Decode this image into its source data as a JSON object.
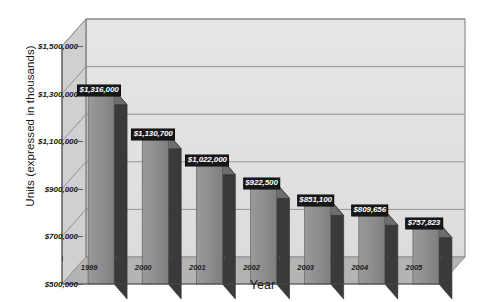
{
  "chart_data": {
    "type": "bar",
    "title": "",
    "subtitle": "",
    "xlabel": "Year",
    "ylabel": "Units (expressed in thousands)",
    "categories": [
      "1999",
      "2000",
      "2001",
      "2002",
      "2003",
      "2004",
      "2005"
    ],
    "values": [
      1316000,
      1130700,
      1022000,
      922500,
      851100,
      809656,
      757823
    ],
    "data_labels": [
      "$1,316,000",
      "$1,130,700",
      "$1,022,000",
      "$922,500",
      "$851,100",
      "$809,656",
      "$757,823"
    ],
    "ylim": [
      500000,
      1500000
    ],
    "ytick_values": [
      500000,
      700000,
      900000,
      1100000,
      1300000,
      1500000
    ],
    "ytick_labels": [
      "$500,000",
      "$700,000",
      "$900,000",
      "$1,100,000",
      "$1,300,000",
      "$1,500,000"
    ],
    "grid": true,
    "legend": null,
    "three_d": true,
    "series": [
      {
        "name": "Units",
        "values": [
          1316000,
          1130700,
          1022000,
          922500,
          851100,
          809656,
          757823
        ]
      }
    ]
  },
  "colors": {
    "bar_front": "#8e8e8e",
    "bar_side": "#3a3a3a",
    "bar_top": "#6d6d6d",
    "plot_back_wall": "#e2e2e2",
    "plot_side_wall": "#d0d0d0",
    "plot_floor": "#b4b4b4",
    "gridline": "#8a8a8a",
    "axis_line": "#4a4a4a",
    "label_bg": "#17171a",
    "label_text": "#ffffff",
    "text": "#1a1a1a",
    "page_bg": "#ffffff"
  },
  "axis": {
    "y_title": "Units (expressed in thousands)",
    "x_title": "Year"
  }
}
